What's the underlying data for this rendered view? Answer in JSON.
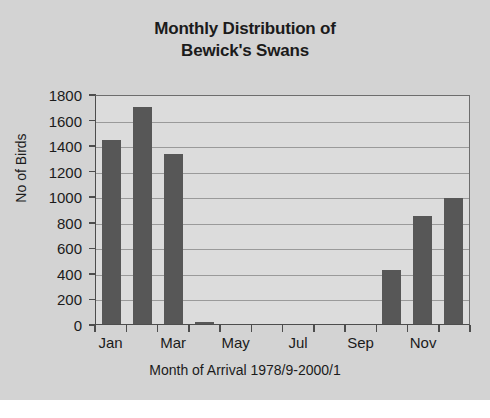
{
  "chart_data": {
    "type": "bar",
    "title": "Monthly Distribution of Bewick's Swans",
    "title_lines": [
      "Monthly Distribution of",
      "Bewick's Swans"
    ],
    "xlabel": "Month of Arrival 1978/9-2000/1",
    "ylabel": "No of Birds",
    "categories": [
      "Jan",
      "Feb",
      "Mar",
      "Apr",
      "May",
      "Jun",
      "Jul",
      "Aug",
      "Sep",
      "Oct",
      "Nov",
      "Dec"
    ],
    "values": [
      1440,
      1700,
      1330,
      15,
      0,
      0,
      0,
      0,
      0,
      425,
      845,
      985
    ],
    "ylim": [
      0,
      1800
    ],
    "ytick_values": [
      0,
      200,
      400,
      600,
      800,
      1000,
      1200,
      1400,
      1600,
      1800
    ],
    "ytick_labels": [
      "0",
      "200",
      "400",
      "600",
      "800",
      "1000",
      "1200",
      "1400",
      "1600",
      "1800"
    ],
    "xtick_labels": [
      "Jan",
      "Mar",
      "May",
      "Jul",
      "Sep",
      "Nov"
    ],
    "xtick_label_indices": [
      0,
      2,
      4,
      6,
      8,
      10
    ],
    "grid": true,
    "legend": false,
    "bar_color": "#575757",
    "plot_background": "#dcdcdc",
    "figure_background": "#d3d3d3",
    "gridline_color": "#9a9a9a",
    "axis_color": "#4d4d4d",
    "text_color": "#1b1b1b"
  }
}
